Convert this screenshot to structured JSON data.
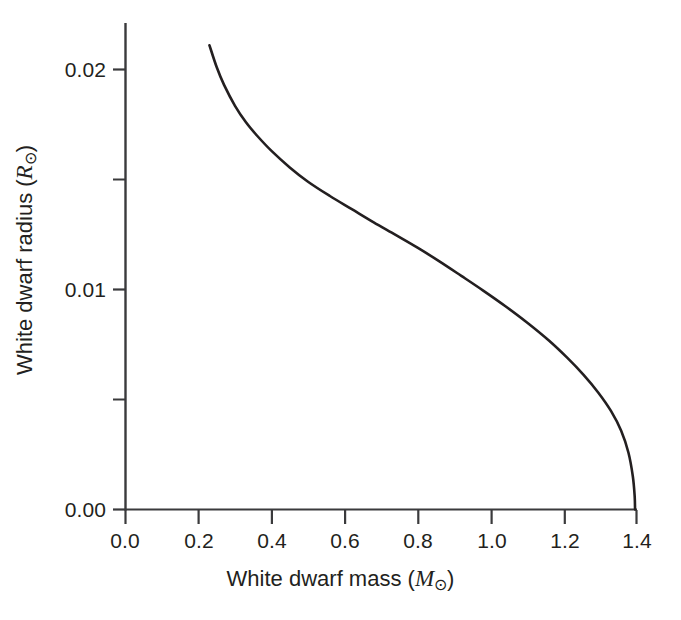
{
  "figure": {
    "background_color": "#ffffff",
    "ink_color": "#231f20",
    "curve_color": "#231f20"
  },
  "axes": {
    "x_title_prefix": "White dwarf mass (",
    "x_title_symbol": "M",
    "x_title_sub": "⊙",
    "x_title_suffix": ")",
    "y_title_prefix": "White dwarf radius (",
    "y_title_symbol": "R",
    "y_title_sub": "⊙",
    "y_title_suffix": ")",
    "x_ticks": [
      "0.0",
      "0.2",
      "0.4",
      "0.6",
      "0.8",
      "1.0",
      "1.2",
      "1.4"
    ],
    "y_ticks": [
      "0.00",
      "0.01",
      "0.02"
    ],
    "y_minor_ticks": [
      "0.005",
      "0.015"
    ]
  },
  "chart_data": {
    "type": "line",
    "title": "",
    "xlabel": "White dwarf mass (M⊙)",
    "ylabel": "White dwarf radius (R⊙)",
    "xlim": [
      0.0,
      1.4
    ],
    "ylim": [
      0.0,
      0.0215
    ],
    "xticks": [
      0.0,
      0.2,
      0.4,
      0.6,
      0.8,
      1.0,
      1.2,
      1.4
    ],
    "yticks": [
      0.0,
      0.01,
      0.02
    ],
    "yticks_minor": [
      0.005,
      0.015
    ],
    "grid": false,
    "legend": null,
    "series": [
      {
        "name": "Chandrasekhar mass–radius relation",
        "x": [
          0.23,
          0.25,
          0.27,
          0.3,
          0.33,
          0.36,
          0.4,
          0.45,
          0.5,
          0.56,
          0.62,
          0.68,
          0.74,
          0.8,
          0.86,
          0.92,
          0.98,
          1.04,
          1.1,
          1.16,
          1.21,
          1.255,
          1.295,
          1.33,
          1.358,
          1.378,
          1.39,
          1.395,
          1.396
        ],
        "y": [
          0.0211,
          0.0201,
          0.0193,
          0.01835,
          0.0176,
          0.017,
          0.0163,
          0.01555,
          0.0149,
          0.01425,
          0.01365,
          0.01305,
          0.01248,
          0.0119,
          0.01128,
          0.01062,
          0.00995,
          0.00925,
          0.0085,
          0.00768,
          0.0069,
          0.00612,
          0.00532,
          0.00448,
          0.00358,
          0.00258,
          0.0015,
          0.0006,
          0.0
        ]
      }
    ]
  }
}
